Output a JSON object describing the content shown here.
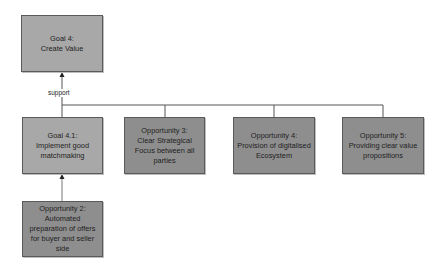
{
  "diagram": {
    "type": "goal-opportunity-tree",
    "nodes": {
      "goal4": {
        "id": "goal4",
        "kind": "goal",
        "title": "Goal 4:",
        "lines": [
          "Create Value"
        ]
      },
      "goal41": {
        "id": "goal41",
        "kind": "goal",
        "title": "Goal 4.1:",
        "lines": [
          "Implement good",
          "matchmaking"
        ]
      },
      "opp2": {
        "id": "opp2",
        "kind": "opportunity",
        "title": "Opportunity 2:",
        "lines": [
          "Automated",
          "preparation of offers",
          "for buyer and seller",
          "side"
        ]
      },
      "opp3": {
        "id": "opp3",
        "kind": "opportunity",
        "title": "Opportunity 3:",
        "lines": [
          "Clear Strategical",
          "Focus between all",
          "parties"
        ]
      },
      "opp4": {
        "id": "opp4",
        "kind": "opportunity",
        "title": "Opportunity 4:",
        "lines": [
          "Provision of digitalised",
          "Ecosystem"
        ]
      },
      "opp5": {
        "id": "opp5",
        "kind": "opportunity",
        "title": "Opportunity 5:",
        "lines": [
          "Providing clear value",
          "propositions"
        ]
      }
    },
    "edges": [
      {
        "from": "goal41",
        "to": "goal4",
        "label": "support"
      },
      {
        "from": "opp3",
        "to": "goal4",
        "label": "support"
      },
      {
        "from": "opp4",
        "to": "goal4",
        "label": "support"
      },
      {
        "from": "opp5",
        "to": "goal4",
        "label": "support"
      },
      {
        "from": "opp2",
        "to": "goal41",
        "label": ""
      }
    ],
    "support_label": "support",
    "colors": {
      "goal_fill": "#a8a8a8",
      "opportunity_fill": "#8e8e8e",
      "border": "#5a5a5a",
      "edge": "#555555",
      "background": "#ffffff"
    }
  }
}
